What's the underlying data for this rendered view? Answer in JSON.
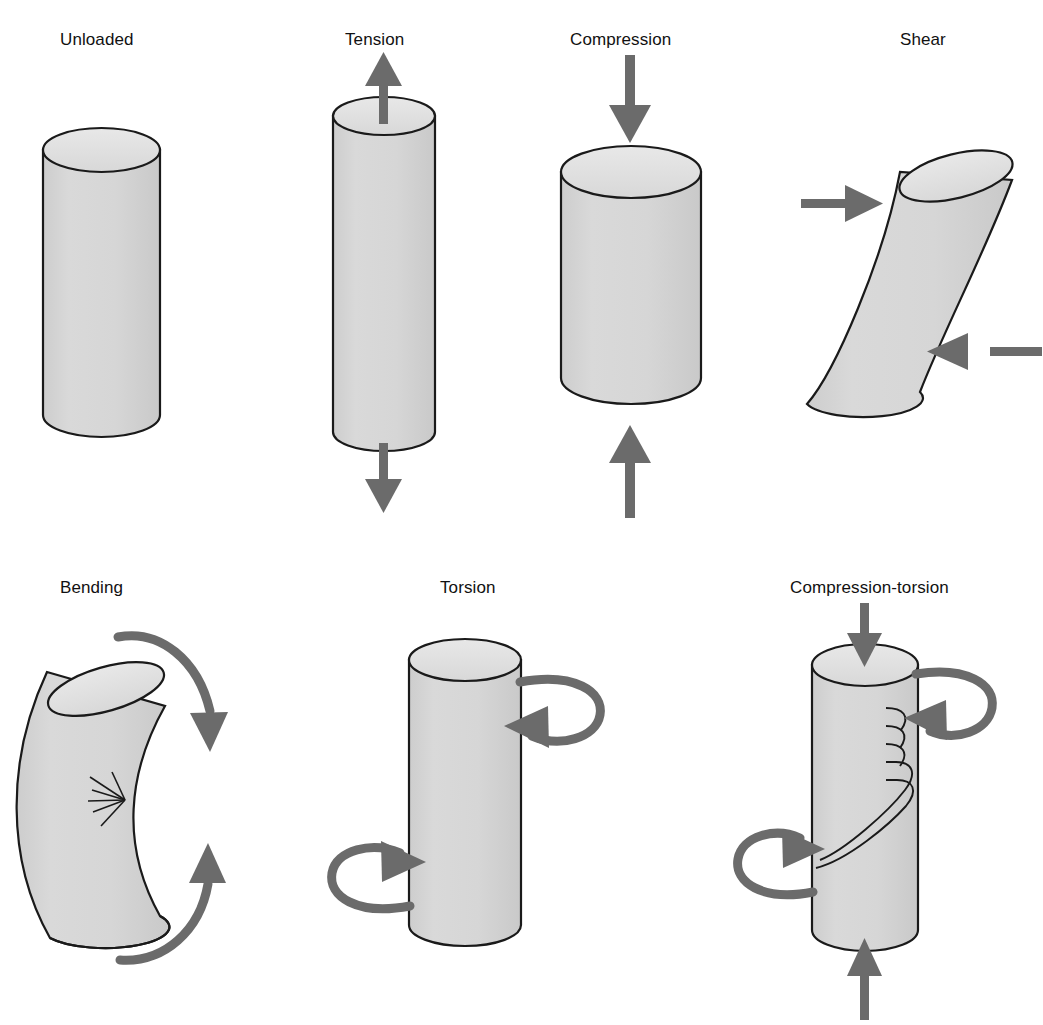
{
  "figure": {
    "background_color": "#ffffff",
    "specimen_fill_color": "#d4d4d4",
    "specimen_top_face_color": "#e0e0e0",
    "specimen_outline_color": "#1a1a1a",
    "arrow_color": "#6b6b6b",
    "label_color": "#111111"
  },
  "panels": [
    {
      "id": "unloaded",
      "label": "Unloaded",
      "label_x": 60,
      "label_y": 30,
      "row": 1,
      "column": 1,
      "specimen": "upright-cylinder",
      "loads": [],
      "fracture": "none",
      "description": "Upright cylinder with no applied load"
    },
    {
      "id": "tension",
      "label": "Tension",
      "label_x": 345,
      "label_y": 30,
      "row": 1,
      "column": 2,
      "specimen": "elongated-cylinder",
      "loads": [
        "arrow-up-top",
        "arrow-down-bottom"
      ],
      "fracture": "none",
      "description": "Elongated cylinder pulled apart by opposing axial arrows"
    },
    {
      "id": "compression",
      "label": "Compression",
      "label_x": 570,
      "label_y": 30,
      "row": 1,
      "column": 3,
      "specimen": "shortened-cylinder",
      "loads": [
        "arrow-down-top",
        "arrow-up-bottom"
      ],
      "fracture": "none",
      "description": "Shortened wide cylinder squeezed by opposing axial arrows"
    },
    {
      "id": "shear",
      "label": "Shear",
      "label_x": 900,
      "label_y": 30,
      "row": 1,
      "column": 4,
      "specimen": "skewed-cylinder",
      "loads": [
        "arrow-right-upper-left",
        "arrow-left-lower-right"
      ],
      "fracture": "none",
      "description": "Slanted cylinder with offset opposing transverse arrows"
    },
    {
      "id": "bending",
      "label": "Bending",
      "label_x": 60,
      "label_y": 578,
      "row": 2,
      "column": 1,
      "specimen": "curved-cylinder",
      "loads": [
        "curved-arrow-down-top",
        "curved-arrow-up-bottom"
      ],
      "fracture": "starburst-crack-on-concave-side",
      "description": "Bowed cylinder with curved moment arrows and a crack on the concave face"
    },
    {
      "id": "torsion",
      "label": "Torsion",
      "label_x": 440,
      "label_y": 578,
      "row": 2,
      "column": 2,
      "specimen": "upright-cylinder",
      "loads": [
        "loop-arrow-top-right",
        "loop-arrow-bottom-left"
      ],
      "fracture": "none",
      "description": "Upright cylinder with two opposing rotational loop arrows"
    },
    {
      "id": "compression-torsion",
      "label": "Compression-torsion",
      "label_x": 790,
      "label_y": 578,
      "row": 2,
      "column": 3,
      "specimen": "upright-cylinder",
      "loads": [
        "arrow-down-top",
        "arrow-up-bottom",
        "loop-arrow-top-right",
        "loop-arrow-bottom-left"
      ],
      "fracture": "helical-spiral-fracture",
      "description": "Upright cylinder under axial compression plus torsion showing a spiral fracture"
    }
  ]
}
